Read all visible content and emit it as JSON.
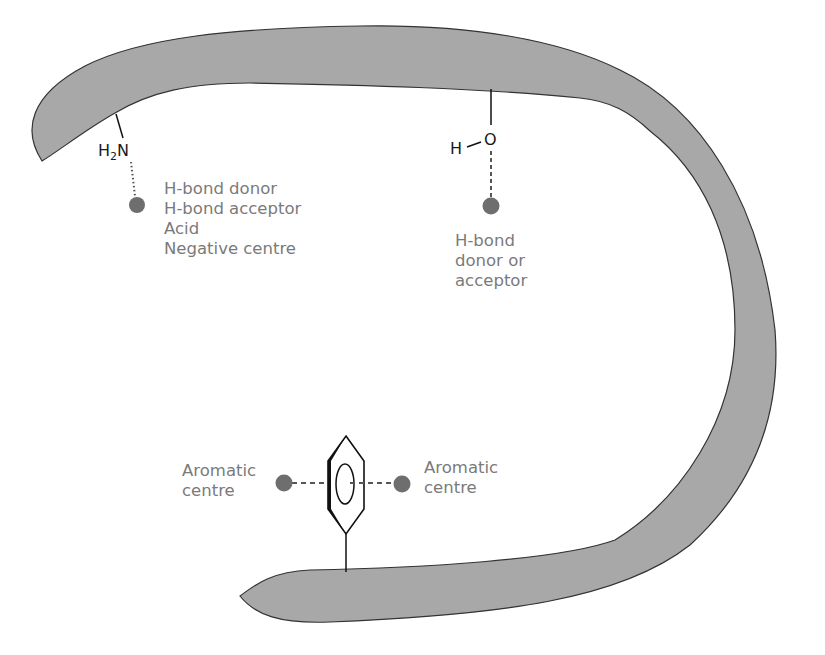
{
  "diagram": {
    "colors": {
      "pocket_fill": "#a8a8a8",
      "pocket_edge": "#333333",
      "point_fill": "#6e6e6e",
      "label_text": "#7a7a7a",
      "bond_line": "#111111"
    },
    "groups": {
      "amine": {
        "formula_main": "H",
        "formula_sub": "2",
        "formula_tail": "N",
        "labels": [
          "H-bond donor",
          "H-bond acceptor",
          "Acid",
          "Negative centre"
        ]
      },
      "hydroxyl": {
        "formula_h": "H",
        "formula_o": "O",
        "labels": [
          "H-bond",
          "donor or",
          "acceptor"
        ]
      },
      "aromatic": {
        "left_labels": [
          "Aromatic",
          "centre"
        ],
        "right_labels": [
          "Aromatic",
          "centre"
        ]
      }
    }
  }
}
